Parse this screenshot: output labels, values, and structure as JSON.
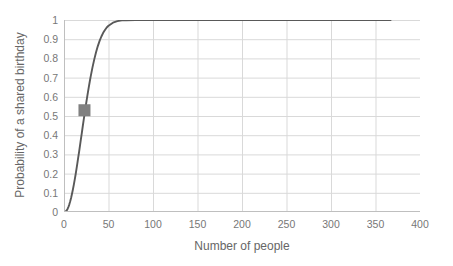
{
  "chart_data": {
    "type": "line",
    "title": "",
    "xlabel": "Number of people",
    "ylabel": "Probability of a shared birthday",
    "xlim": [
      0,
      400
    ],
    "ylim": [
      0,
      1
    ],
    "grid": true,
    "legend": "none",
    "xticks": [
      "0",
      "50",
      "100",
      "150",
      "200",
      "250",
      "300",
      "350",
      "400"
    ],
    "xtick_values": [
      0,
      50,
      100,
      150,
      200,
      250,
      300,
      350,
      400
    ],
    "yticks": [
      "0",
      "0.1",
      "0.2",
      "0.3",
      "0.4",
      "0.5",
      "0.6",
      "0.7",
      "0.8",
      "0.9",
      "1"
    ],
    "ytick_values": [
      0,
      0.1,
      0.2,
      0.3,
      0.4,
      0.5,
      0.6,
      0.7,
      0.8,
      0.9,
      1
    ],
    "line_color": "#595959",
    "marker_color": "#808080",
    "grid_color": "#d9d9d9",
    "background_color": "#ffffff",
    "series": [
      {
        "name": "Probability of a shared birthday",
        "x": [
          1,
          2,
          3,
          4,
          5,
          6,
          7,
          8,
          9,
          10,
          11,
          12,
          13,
          14,
          15,
          16,
          17,
          18,
          19,
          20,
          21,
          22,
          23,
          24,
          25,
          26,
          27,
          28,
          29,
          30,
          32,
          34,
          36,
          38,
          40,
          42,
          44,
          46,
          48,
          50,
          55,
          60,
          65,
          70,
          80,
          90,
          100,
          120,
          140,
          160,
          180,
          200,
          225,
          250,
          275,
          300,
          325,
          350,
          367
        ],
        "y": [
          0,
          0.003,
          0.008,
          0.016,
          0.027,
          0.04,
          0.056,
          0.074,
          0.095,
          0.117,
          0.141,
          0.167,
          0.194,
          0.223,
          0.253,
          0.284,
          0.315,
          0.347,
          0.379,
          0.411,
          0.444,
          0.476,
          0.507,
          0.538,
          0.569,
          0.598,
          0.627,
          0.654,
          0.681,
          0.706,
          0.753,
          0.795,
          0.832,
          0.864,
          0.891,
          0.914,
          0.933,
          0.948,
          0.961,
          0.97,
          0.986,
          0.994,
          0.998,
          0.999,
          1,
          1,
          1,
          1,
          1,
          1,
          1,
          1,
          1,
          1,
          1,
          1,
          1,
          1,
          1
        ]
      }
    ],
    "markers": [
      {
        "label": "23 people",
        "x": 23,
        "y": 0.53,
        "shape": "square",
        "color": "#808080"
      }
    ]
  }
}
